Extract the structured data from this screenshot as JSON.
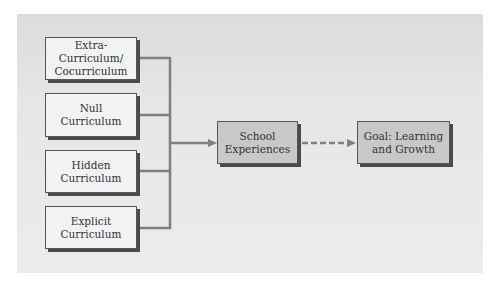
{
  "diagram": {
    "sources": [
      {
        "lines": [
          "Extra-",
          "Curriculum/",
          "Cocurriculum"
        ]
      },
      {
        "lines": [
          "Null",
          "Curriculum"
        ]
      },
      {
        "lines": [
          "Hidden",
          "Curriculum"
        ]
      },
      {
        "lines": [
          "Explicit",
          "Curriculum"
        ]
      }
    ],
    "middle": {
      "lines": [
        "School",
        "Experiences"
      ]
    },
    "goal": {
      "lines": [
        "Goal: Learning",
        "and Growth"
      ]
    },
    "connectors": [
      {
        "from": "sources",
        "to": "middle",
        "style": "solid"
      },
      {
        "from": "middle",
        "to": "goal",
        "style": "dashed"
      }
    ],
    "colors": {
      "line": "#7a7a7a",
      "box_light": "#f2f2f2",
      "box_dark": "#c8c8c8"
    }
  }
}
